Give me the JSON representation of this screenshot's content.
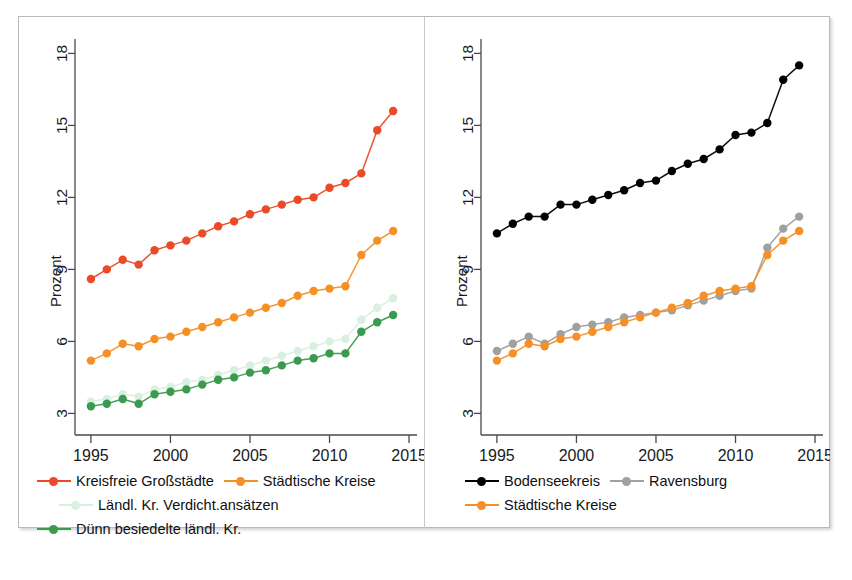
{
  "figure": {
    "panels": [
      "left",
      "right"
    ]
  },
  "colors": {
    "red": "#ea4a28",
    "orange": "#f59026",
    "green": "#3a9b4e",
    "light_green": "#d8f0df",
    "black": "#000000",
    "grey": "#a0a0a0",
    "axis": "#4a4a4a",
    "frame": "#b9b9b9"
  },
  "chart_data": [
    {
      "type": "line",
      "panel": "left",
      "title": "",
      "xlabel": "",
      "ylabel": "Prozent",
      "xlim": [
        1994,
        2015.5
      ],
      "ylim": [
        2.1,
        18.6
      ],
      "xticks": [
        1995,
        2000,
        2005,
        2010,
        2015
      ],
      "yticks": [
        3,
        6,
        9,
        12,
        15,
        18
      ],
      "grid": false,
      "legend_position": "below",
      "x": [
        1995,
        1996,
        1997,
        1998,
        1999,
        2000,
        2001,
        2002,
        2003,
        2004,
        2005,
        2006,
        2007,
        2008,
        2009,
        2010,
        2011,
        2012,
        2013,
        2014
      ],
      "series": [
        {
          "name": "Kreisfreie Großstädte",
          "color": "#ea4a28",
          "marker": "circle",
          "values": [
            8.6,
            9.0,
            9.4,
            9.2,
            9.8,
            10.0,
            10.2,
            10.5,
            10.8,
            11.0,
            11.3,
            11.5,
            11.7,
            11.9,
            12.0,
            12.4,
            12.6,
            13.0,
            14.8,
            15.6,
            16.3
          ]
        },
        {
          "name": "Städtische Kreise",
          "color": "#f59026",
          "marker": "circle",
          "values": [
            5.2,
            5.5,
            5.9,
            5.8,
            6.1,
            6.2,
            6.4,
            6.6,
            6.8,
            7.0,
            7.2,
            7.4,
            7.6,
            7.9,
            8.1,
            8.2,
            8.3,
            9.6,
            10.2,
            10.6
          ]
        },
        {
          "name": "Ländl. Kr. Verdicht.ansätzen",
          "color": "#d8f0df",
          "marker": "circle",
          "values": [
            3.5,
            3.6,
            3.8,
            3.7,
            4.0,
            4.1,
            4.3,
            4.4,
            4.6,
            4.8,
            5.0,
            5.2,
            5.4,
            5.6,
            5.8,
            6.0,
            6.1,
            6.9,
            7.4,
            7.8
          ]
        },
        {
          "name": "Dünn besiedelte ländl. Kr.",
          "color": "#3a9b4e",
          "marker": "circle",
          "values": [
            3.3,
            3.4,
            3.6,
            3.4,
            3.8,
            3.9,
            4.0,
            4.2,
            4.4,
            4.5,
            4.7,
            4.8,
            5.0,
            5.2,
            5.3,
            5.5,
            5.5,
            6.4,
            6.8,
            7.1
          ]
        }
      ]
    },
    {
      "type": "line",
      "panel": "right",
      "title": "",
      "xlabel": "",
      "ylabel": "Prozent",
      "xlim": [
        1994,
        2015.5
      ],
      "ylim": [
        2.1,
        18.6
      ],
      "xticks": [
        1995,
        2000,
        2005,
        2010,
        2015
      ],
      "yticks": [
        3,
        6,
        9,
        12,
        15,
        18
      ],
      "grid": false,
      "legend_position": "below",
      "x": [
        1995,
        1996,
        1997,
        1998,
        1999,
        2000,
        2001,
        2002,
        2003,
        2004,
        2005,
        2006,
        2007,
        2008,
        2009,
        2010,
        2011,
        2012,
        2013,
        2014
      ],
      "series": [
        {
          "name": "Bodenseekreis",
          "color": "#000000",
          "marker": "circle",
          "values": [
            10.5,
            10.9,
            11.2,
            11.2,
            11.7,
            11.7,
            11.9,
            12.1,
            12.3,
            12.6,
            12.7,
            13.1,
            13.4,
            13.6,
            14.0,
            14.6,
            14.7,
            15.1,
            16.9,
            17.5,
            18.0
          ]
        },
        {
          "name": "Ravensburg",
          "color": "#a0a0a0",
          "marker": "circle",
          "values": [
            5.6,
            5.9,
            6.2,
            5.9,
            6.3,
            6.6,
            6.7,
            6.8,
            7.0,
            7.1,
            7.2,
            7.3,
            7.5,
            7.7,
            7.9,
            8.1,
            8.2,
            9.9,
            10.7,
            11.2
          ]
        },
        {
          "name": "Städtische Kreise",
          "color": "#f59026",
          "marker": "circle",
          "values": [
            5.2,
            5.5,
            5.9,
            5.8,
            6.1,
            6.2,
            6.4,
            6.6,
            6.8,
            7.0,
            7.2,
            7.4,
            7.6,
            7.9,
            8.1,
            8.2,
            8.3,
            9.6,
            10.2,
            10.6
          ]
        }
      ]
    }
  ],
  "axis": {
    "ylabel": "Prozent",
    "yticks": [
      "3",
      "6",
      "9",
      "12",
      "15",
      "18"
    ],
    "xticks": [
      "1995",
      "2000",
      "2005",
      "2010",
      "2015"
    ]
  },
  "legend_left": {
    "rows": [
      [
        {
          "label": "Kreisfreie Großstädte",
          "color": "#ea4a28",
          "has_line": true,
          "indent": false
        },
        {
          "label": "Städtische Kreise",
          "color": "#f59026",
          "has_line": true,
          "indent": false
        }
      ],
      [
        {
          "label": "Ländl. Kr. Verdicht.ansätzen",
          "color": "#d8f0df",
          "has_line": true,
          "indent": true
        }
      ],
      [
        {
          "label": "Dünn besiedelte ländl. Kr.",
          "color": "#3a9b4e",
          "has_line": true,
          "indent": false
        }
      ]
    ]
  },
  "legend_right": {
    "rows": [
      [
        {
          "label": "Bodenseekreis",
          "color": "#000000",
          "has_line": true,
          "indent": true
        },
        {
          "label": "Ravensburg",
          "color": "#a0a0a0",
          "has_line": true,
          "indent": false
        }
      ],
      [
        {
          "label": "Städtische Kreise",
          "color": "#f59026",
          "has_line": true,
          "indent": true
        }
      ]
    ]
  }
}
